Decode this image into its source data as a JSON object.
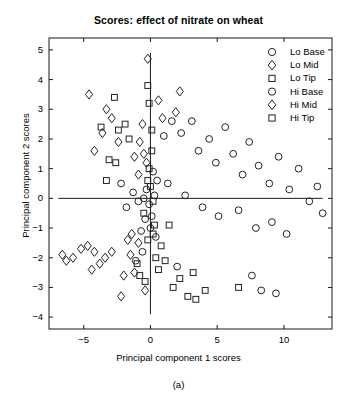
{
  "chart_data": {
    "type": "scatter",
    "title": "Scores: effect of nitrate on wheat",
    "xlabel": "Principal component 1 scores",
    "ylabel": "Principal component 2 scores",
    "caption": "(a)",
    "xlim": [
      -7.6,
      13.6
    ],
    "ylim": [
      -4.4,
      5.4
    ],
    "xticks": [
      -5,
      0,
      5,
      10
    ],
    "yticks": [
      5,
      4,
      3,
      2,
      1,
      0,
      -1,
      -2,
      -3,
      -4
    ],
    "grid": false,
    "legend_position": "top-right",
    "reference_lines": {
      "vertical_x": 0,
      "horizontal_y": 0,
      "color": "#000000"
    },
    "marker_color": "#222222",
    "marker_fill": "none",
    "series": [
      {
        "name": "Lo Base",
        "marker": "circle",
        "points": [
          [
            0.2,
            0.9
          ],
          [
            0.3,
            0.1
          ],
          [
            -0.1,
            -0.2
          ],
          [
            -0.5,
            0.0
          ],
          [
            -0.9,
            -0.1
          ],
          [
            -0.4,
            -0.7
          ],
          [
            0.1,
            -0.6
          ],
          [
            -0.7,
            -1.1
          ],
          [
            0.4,
            -1.3
          ],
          [
            1.0,
            2.1
          ],
          [
            1.6,
            2.6
          ],
          [
            2.3,
            2.2
          ],
          [
            3.1,
            2.6
          ],
          [
            3.6,
            1.6
          ],
          [
            4.4,
            2.0
          ],
          [
            4.9,
            1.2
          ],
          [
            5.6,
            2.4
          ],
          [
            6.2,
            1.5
          ],
          [
            6.9,
            0.8
          ],
          [
            7.4,
            1.9
          ],
          [
            8.1,
            1.1
          ],
          [
            8.9,
            0.5
          ],
          [
            9.6,
            1.4
          ],
          [
            10.4,
            0.3
          ],
          [
            11.1,
            1.0
          ],
          [
            11.9,
            -0.1
          ],
          [
            12.5,
            0.4
          ],
          [
            12.9,
            -0.5
          ],
          [
            2.6,
            0.1
          ],
          [
            3.9,
            -0.3
          ],
          [
            5.1,
            -0.6
          ],
          [
            6.6,
            -0.4
          ],
          [
            7.9,
            -1.0
          ],
          [
            9.1,
            -0.8
          ],
          [
            10.2,
            -1.2
          ],
          [
            8.3,
            -3.1
          ],
          [
            9.4,
            -3.2
          ],
          [
            7.6,
            -2.6
          ],
          [
            2.0,
            -2.3
          ],
          [
            1.3,
            0.5
          ]
        ]
      },
      {
        "name": "Lo Mid",
        "marker": "diamond",
        "points": [
          [
            -0.2,
            4.7
          ],
          [
            -4.6,
            3.5
          ],
          [
            -3.3,
            3.0
          ],
          [
            -2.9,
            2.7
          ],
          [
            -3.6,
            2.2
          ],
          [
            -4.2,
            1.6
          ],
          [
            -2.4,
            1.9
          ],
          [
            -0.6,
            2.5
          ],
          [
            -0.8,
            1.9
          ],
          [
            0.6,
            3.3
          ],
          [
            0.9,
            2.7
          ],
          [
            -1.2,
            1.4
          ],
          [
            -0.3,
            1.2
          ],
          [
            -5.2,
            -1.7
          ],
          [
            -5.8,
            -2.0
          ],
          [
            -6.3,
            -2.1
          ],
          [
            -6.6,
            -1.9
          ],
          [
            -4.7,
            -1.6
          ],
          [
            -4.2,
            -1.8
          ],
          [
            -3.8,
            -2.2
          ],
          [
            -4.4,
            -2.4
          ],
          [
            -3.4,
            -2.0
          ],
          [
            -2.9,
            -1.8
          ],
          [
            -2.2,
            -3.3
          ],
          [
            -1.5,
            -1.9
          ],
          [
            -1.2,
            -2.5
          ],
          [
            -0.9,
            -1.5
          ],
          [
            2.2,
            3.6
          ],
          [
            1.9,
            2.9
          ],
          [
            -0.4,
            -3.1
          ]
        ]
      },
      {
        "name": "Lo Tip",
        "marker": "square",
        "points": [
          [
            -2.7,
            3.4
          ],
          [
            -3.7,
            2.4
          ],
          [
            -2.4,
            2.3
          ],
          [
            -1.9,
            2.5
          ],
          [
            -1.6,
            2.0
          ],
          [
            -3.1,
            1.3
          ],
          [
            -2.6,
            1.2
          ],
          [
            -3.3,
            0.6
          ],
          [
            -0.2,
            3.8
          ],
          [
            -0.1,
            3.2
          ],
          [
            0.1,
            2.3
          ],
          [
            0.2,
            -0.1
          ],
          [
            0.0,
            0.4
          ],
          [
            -0.1,
            1.0
          ],
          [
            0.3,
            -0.9
          ],
          [
            -0.2,
            -1.4
          ],
          [
            0.4,
            -2.0
          ],
          [
            0.6,
            -2.4
          ],
          [
            1.1,
            -2.1
          ],
          [
            1.7,
            -3.0
          ],
          [
            2.2,
            -2.7
          ],
          [
            2.8,
            -3.3
          ],
          [
            3.4,
            -3.4
          ],
          [
            3.2,
            -2.5
          ],
          [
            4.1,
            -3.1
          ],
          [
            6.6,
            -3.0
          ],
          [
            -0.4,
            -2.8
          ],
          [
            -1.0,
            -2.2
          ],
          [
            0.8,
            -1.6
          ],
          [
            1.4,
            -0.9
          ]
        ]
      },
      {
        "name": "Hi Base",
        "marker": "circle",
        "points": [
          [
            -1.3,
            0.2
          ],
          [
            -1.8,
            -0.3
          ],
          [
            -2.2,
            0.5
          ],
          [
            -0.6,
            -1.8
          ],
          [
            -1.1,
            -2.1
          ],
          [
            0.0,
            -1.0
          ],
          [
            0.5,
            0.6
          ],
          [
            -0.3,
            0.3
          ]
        ]
      },
      {
        "name": "Hi Mid",
        "marker": "diamond",
        "points": [
          [
            -0.9,
            0.8
          ],
          [
            -0.5,
            1.5
          ],
          [
            -1.4,
            -1.2
          ],
          [
            -2.0,
            -2.6
          ],
          [
            -1.7,
            -1.4
          ]
        ]
      },
      {
        "name": "Hi Tip",
        "marker": "square",
        "points": [
          [
            -0.2,
            0.6
          ],
          [
            0.1,
            1.6
          ],
          [
            -0.5,
            -0.5
          ],
          [
            0.2,
            -1.2
          ],
          [
            -0.8,
            -2.6
          ]
        ]
      }
    ]
  },
  "legend": {
    "entries": [
      {
        "label": "Lo Base",
        "marker": "circle"
      },
      {
        "label": "Lo Mid",
        "marker": "diamond"
      },
      {
        "label": "Lo Tip",
        "marker": "square"
      },
      {
        "label": "Hi Base",
        "marker": "circle"
      },
      {
        "label": "Hi Mid",
        "marker": "diamond"
      },
      {
        "label": "Hi Tip",
        "marker": "square"
      }
    ]
  },
  "axis": {
    "x_tick_labels": [
      "-5",
      "0",
      "5",
      "10"
    ],
    "y_tick_labels": [
      "5",
      "4",
      "3",
      "2",
      "1",
      "0",
      "-1",
      "-2",
      "-3",
      "-4"
    ]
  }
}
